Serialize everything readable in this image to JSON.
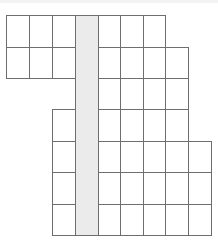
{
  "diagram": {
    "x_lines": [
      6,
      29,
      52,
      75,
      98,
      120,
      143,
      165,
      188,
      211
    ],
    "y_lines": [
      15,
      47,
      78,
      109,
      141,
      172,
      204,
      235
    ],
    "rows": [
      {
        "y0": 15,
        "y1": 47,
        "cols": [
          [
            6,
            29
          ],
          [
            29,
            52
          ],
          [
            52,
            75
          ],
          [
            98,
            120
          ],
          [
            120,
            143
          ],
          [
            143,
            165
          ]
        ]
      },
      {
        "y0": 47,
        "y1": 78,
        "cols": [
          [
            6,
            29
          ],
          [
            29,
            52
          ],
          [
            52,
            75
          ],
          [
            98,
            120
          ],
          [
            120,
            143
          ],
          [
            143,
            165
          ],
          [
            165,
            188
          ]
        ]
      },
      {
        "y0": 78,
        "y1": 109,
        "cols": [
          [
            98,
            120
          ],
          [
            120,
            143
          ],
          [
            143,
            165
          ],
          [
            165,
            188
          ]
        ]
      },
      {
        "y0": 109,
        "y1": 141,
        "cols": [
          [
            52,
            75
          ],
          [
            98,
            120
          ],
          [
            120,
            143
          ],
          [
            143,
            165
          ],
          [
            165,
            188
          ]
        ]
      },
      {
        "y0": 141,
        "y1": 172,
        "cols": [
          [
            52,
            75
          ],
          [
            98,
            120
          ],
          [
            120,
            143
          ],
          [
            143,
            165
          ],
          [
            165,
            188
          ],
          [
            188,
            211
          ]
        ]
      },
      {
        "y0": 172,
        "y1": 204,
        "cols": [
          [
            52,
            75
          ],
          [
            98,
            120
          ],
          [
            120,
            143
          ],
          [
            143,
            165
          ],
          [
            165,
            188
          ],
          [
            188,
            211
          ]
        ]
      },
      {
        "y0": 204,
        "y1": 235,
        "cols": [
          [
            52,
            75
          ],
          [
            98,
            120
          ],
          [
            120,
            143
          ],
          [
            143,
            165
          ],
          [
            165,
            188
          ],
          [
            188,
            211
          ]
        ]
      }
    ],
    "shaded_column": {
      "x0": 75,
      "x1": 98,
      "y0": 15,
      "y1": 235,
      "color": "#ebebeb"
    },
    "line_color": "#6e6e6e"
  }
}
